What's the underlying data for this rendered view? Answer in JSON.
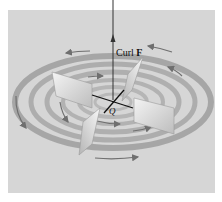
{
  "figure": {
    "axis_label_prefix": "Curl ",
    "axis_label_vector": "F",
    "point_label": "Q",
    "colors": {
      "background": "#d6d6d6",
      "ring": "#9a9a9a",
      "flow_arrow": "#6f6f6f",
      "paddle": "#eeeeee",
      "axis": "#333333"
    }
  }
}
